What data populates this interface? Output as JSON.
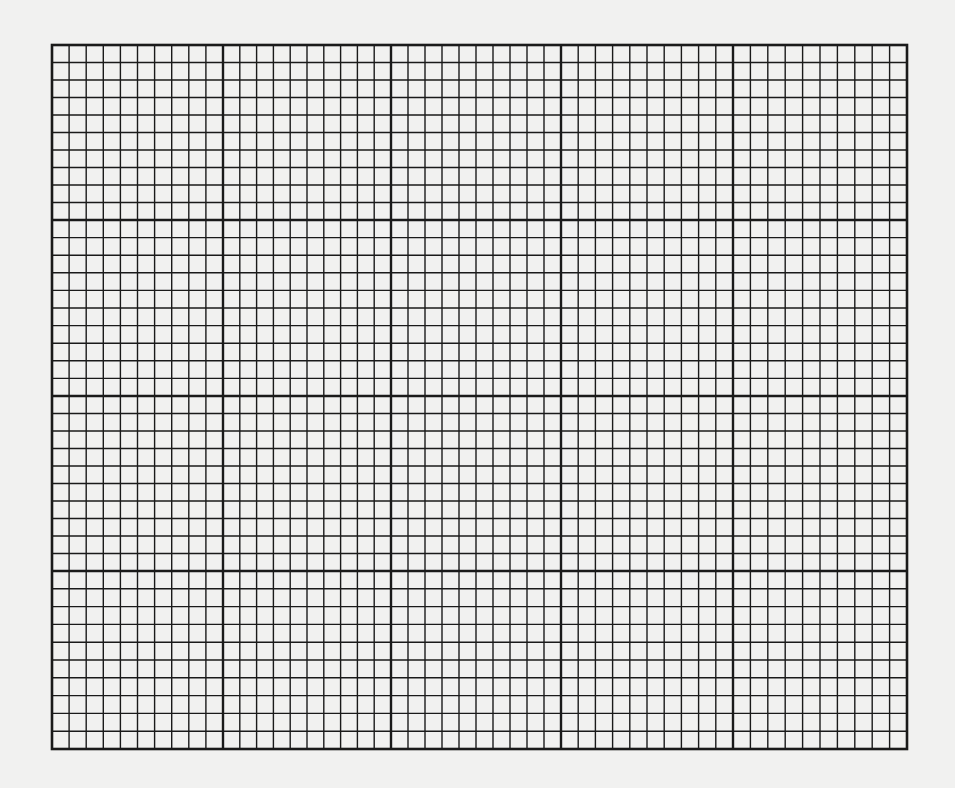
{
  "page": {
    "background_color": "#f1f1f0",
    "line_color": "#1a1a1a"
  },
  "grid": {
    "left": 52,
    "top": 45,
    "right": 907,
    "bottom": 749,
    "major_x": [
      52,
      223,
      391,
      561,
      733,
      907
    ],
    "major_y": [
      45,
      220,
      396,
      571,
      749
    ],
    "minor_per_major": 10,
    "major_columns": 5,
    "major_rows": 4,
    "total_columns": 50,
    "total_rows": 40,
    "minor_line_width": 1.4,
    "major_line_width": 2.4,
    "border_line_width": 2.6
  }
}
